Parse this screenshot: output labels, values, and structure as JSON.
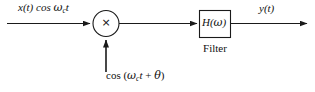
{
  "diagram": {
    "stroke_color": "#1a1a1a",
    "background_color": "#ffffff",
    "input": {
      "signal_text": "x(t) cos ",
      "carrier_omega": "ω",
      "carrier_subscript": "c",
      "carrier_time": "t",
      "full_text": "x(t) cos ωct"
    },
    "multiplier": {
      "symbol": "×",
      "name": "multiplier"
    },
    "oscillator": {
      "prefix": "cos (",
      "omega": "ω",
      "subscript": "c",
      "time": "t",
      "plus_phase": " + ",
      "theta": "θ",
      "suffix": ")",
      "full_text": "cos (ωct + θ)"
    },
    "filter": {
      "transfer_h": "H(",
      "transfer_omega": "ω",
      "transfer_close": ")",
      "transfer_full": "H(ω)",
      "caption": "Filter"
    },
    "output": {
      "signal_text": "y(t)"
    }
  }
}
